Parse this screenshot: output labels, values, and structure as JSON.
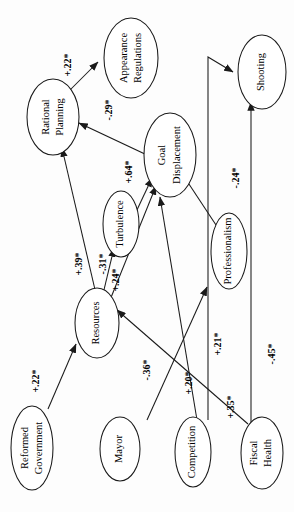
{
  "figure": {
    "orientation": "rotated-90-ccw",
    "type": "path-diagram",
    "ink_color": "#1a1a1a",
    "background_color": "#fdfdfd"
  },
  "nodes": [
    {
      "id": "appearance_regulations",
      "label_line1": "Appearance",
      "label_line2": "Regulations"
    },
    {
      "id": "rational_planning",
      "label_line1": "Rational",
      "label_line2": "Planning"
    },
    {
      "id": "goal_displacement",
      "label_line1": "Goal",
      "label_line2": "Displacement"
    },
    {
      "id": "shooting",
      "label_line1": "Shooting",
      "label_line2": ""
    },
    {
      "id": "turbulence",
      "label_line1": "Turbulence",
      "label_line2": ""
    },
    {
      "id": "professionalism",
      "label_line1": "Professionalism",
      "label_line2": ""
    },
    {
      "id": "resources",
      "label_line1": "Resources",
      "label_line2": ""
    },
    {
      "id": "reformed_government",
      "label_line1": "Reformed",
      "label_line2": "Government"
    },
    {
      "id": "mayor",
      "label_line1": "Mayor",
      "label_line2": ""
    },
    {
      "id": "competition",
      "label_line1": "Competition",
      "label_line2": ""
    },
    {
      "id": "fiscal_health",
      "label_line1": "Fiscal",
      "label_line2": "Health"
    }
  ],
  "edges": [
    {
      "id": "e1",
      "from": "rational_planning",
      "to": "appearance_regulations",
      "coefficient": "+.22*"
    },
    {
      "id": "e2",
      "from": "goal_displacement",
      "to": "rational_planning",
      "coefficient": "-.29*"
    },
    {
      "id": "e3",
      "from": "turbulence",
      "to": "goal_displacement",
      "coefficient": "+.64*"
    },
    {
      "id": "e4",
      "from": "resources",
      "to": "rational_planning",
      "coefficient": "+.39*"
    },
    {
      "id": "e5",
      "from": "resources",
      "to": "turbulence",
      "coefficient": "-.31*"
    },
    {
      "id": "e6",
      "from": "resources",
      "to": "goal_displacement",
      "coefficient": "+.24*"
    },
    {
      "id": "e7",
      "from": "professionalism",
      "to": "goal_displacement",
      "coefficient": "-.24*"
    },
    {
      "id": "e8",
      "from": "reformed_government",
      "to": "resources",
      "coefficient": "+.22*"
    },
    {
      "id": "e9",
      "from": "mayor",
      "to": "professionalism",
      "coefficient": "-.36*"
    },
    {
      "id": "e10",
      "from": "competition",
      "to": "goal_displacement",
      "coefficient": "+.20*"
    },
    {
      "id": "e11",
      "from": "competition",
      "to": "shooting",
      "coefficient": "+.21*"
    },
    {
      "id": "e12",
      "from": "fiscal_health",
      "to": "resources",
      "coefficient": "+.35*"
    },
    {
      "id": "e13",
      "from": "fiscal_health",
      "to": "shooting",
      "coefficient": "-.45*"
    }
  ],
  "labels": {
    "c_22a": "+.22*",
    "c_29": "-.29*",
    "c_64": "+.64*",
    "c_39": "+.39*",
    "c_31": "-.31*",
    "c_24a": "+.24*",
    "c_24b": "-.24*",
    "c_22b": "+.22*",
    "c_36": "-.36*",
    "c_20": "+.20*",
    "c_21": "+.21*",
    "c_35": "+.35*",
    "c_45": "-.45*"
  }
}
